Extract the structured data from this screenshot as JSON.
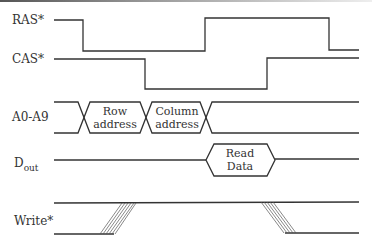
{
  "diagram": {
    "type": "timing-diagram",
    "signals": [
      {
        "name": "RAS*",
        "label": "RAS*"
      },
      {
        "name": "CAS*",
        "label": "CAS*"
      },
      {
        "name": "A0-A9",
        "label": "A0-A9"
      },
      {
        "name": "Dout",
        "label_main": "D",
        "label_sub": "out"
      },
      {
        "name": "Write*",
        "label": "Write*"
      }
    ],
    "address_phases": [
      {
        "line1": "Row",
        "line2": "address"
      },
      {
        "line1": "Column",
        "line2": "address"
      }
    ],
    "data_phase": {
      "line1": "Read",
      "line2": "Data"
    },
    "colors": {
      "line": "#333333",
      "background": "#ffffff"
    }
  }
}
